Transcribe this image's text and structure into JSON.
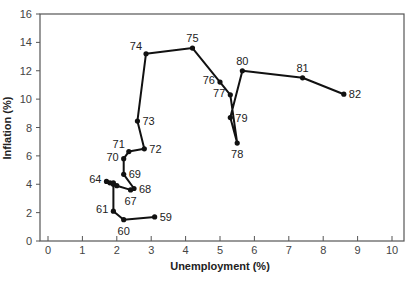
{
  "chart_data": {
    "type": "line",
    "title": "",
    "xlabel": "Unemployment (%)",
    "ylabel": "Inflation (%)",
    "xlim": [
      0,
      10
    ],
    "ylim": [
      0,
      16
    ],
    "x_ticks": [
      0,
      1,
      2,
      3,
      4,
      5,
      6,
      7,
      8,
      9,
      10
    ],
    "y_ticks": [
      0,
      2,
      4,
      6,
      8,
      10,
      12,
      14,
      16
    ],
    "grid": false,
    "legend": null,
    "series": [
      {
        "name": "Phillips curve path 1959-1982",
        "points": [
          {
            "label": "59",
            "x": 3.1,
            "y": 1.7,
            "show_label": true,
            "label_pos": "right"
          },
          {
            "label": "60",
            "x": 2.2,
            "y": 1.5,
            "show_label": true,
            "label_pos": "below"
          },
          {
            "label": "61",
            "x": 1.9,
            "y": 2.1,
            "show_label": true,
            "label_pos": "left"
          },
          {
            "label": "62",
            "x": 1.9,
            "y": 4.0,
            "show_label": false,
            "label_pos": "none"
          },
          {
            "label": "63",
            "x": 1.8,
            "y": 4.1,
            "show_label": false,
            "label_pos": "none"
          },
          {
            "label": "64",
            "x": 1.7,
            "y": 4.2,
            "show_label": true,
            "label_pos": "left"
          },
          {
            "label": "65",
            "x": 1.9,
            "y": 4.1,
            "show_label": false,
            "label_pos": "none"
          },
          {
            "label": "66",
            "x": 2.0,
            "y": 3.9,
            "show_label": false,
            "label_pos": "none"
          },
          {
            "label": "67",
            "x": 2.4,
            "y": 3.6,
            "show_label": true,
            "label_pos": "below"
          },
          {
            "label": "68",
            "x": 2.5,
            "y": 3.7,
            "show_label": true,
            "label_pos": "right"
          },
          {
            "label": "69",
            "x": 2.2,
            "y": 4.7,
            "show_label": true,
            "label_pos": "right"
          },
          {
            "label": "70",
            "x": 2.2,
            "y": 5.8,
            "show_label": true,
            "label_pos": "left"
          },
          {
            "label": "71",
            "x": 2.35,
            "y": 6.3,
            "show_label": true,
            "label_pos": "upleft"
          },
          {
            "label": "72",
            "x": 2.8,
            "y": 6.5,
            "show_label": true,
            "label_pos": "right"
          },
          {
            "label": "73",
            "x": 2.6,
            "y": 8.45,
            "show_label": true,
            "label_pos": "right"
          },
          {
            "label": "74",
            "x": 2.85,
            "y": 13.2,
            "show_label": true,
            "label_pos": "upleft"
          },
          {
            "label": "75",
            "x": 4.2,
            "y": 13.6,
            "show_label": true,
            "label_pos": "above"
          },
          {
            "label": "76",
            "x": 5.0,
            "y": 11.2,
            "show_label": true,
            "label_pos": "left"
          },
          {
            "label": "77",
            "x": 5.3,
            "y": 10.3,
            "show_label": true,
            "label_pos": "left"
          },
          {
            "label": "78",
            "x": 5.5,
            "y": 6.9,
            "show_label": true,
            "label_pos": "below"
          },
          {
            "label": "79",
            "x": 5.3,
            "y": 8.7,
            "show_label": true,
            "label_pos": "right"
          },
          {
            "label": "80",
            "x": 5.65,
            "y": 12.0,
            "show_label": true,
            "label_pos": "above"
          },
          {
            "label": "81",
            "x": 7.4,
            "y": 11.5,
            "show_label": true,
            "label_pos": "above"
          },
          {
            "label": "82",
            "x": 8.6,
            "y": 10.35,
            "show_label": true,
            "label_pos": "right"
          }
        ]
      }
    ]
  },
  "style": {
    "line_color": "#111111",
    "axis_color": "#555555",
    "background": "#ffffff"
  }
}
